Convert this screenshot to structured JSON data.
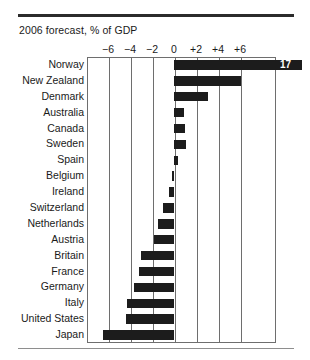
{
  "chart_data": {
    "type": "bar",
    "orientation": "horizontal",
    "title": "2006 forecast, % of GDP",
    "xlabel": "",
    "ylabel": "",
    "xlim": [
      -7.2,
      10.0
    ],
    "xticks": [
      -6,
      -4,
      -2,
      0,
      2,
      4,
      6
    ],
    "xticklabels": [
      "−6",
      "−4",
      "−2",
      "0",
      "+2",
      "+4",
      "+6"
    ],
    "grid": true,
    "grid_axis": "x",
    "legend": false,
    "bar_color": "#1c1c1c",
    "categories": [
      "Norway",
      "New Zealand",
      "Denmark",
      "Australia",
      "Canada",
      "Sweden",
      "Spain",
      "Belgium",
      "Ireland",
      "Switzerland",
      "Netherlands",
      "Austria",
      "Britain",
      "France",
      "Germany",
      "Italy",
      "United States",
      "Japan"
    ],
    "values": [
      17.0,
      6.1,
      3.1,
      0.9,
      1.0,
      1.1,
      0.4,
      -0.2,
      -0.5,
      -1.0,
      -1.5,
      -1.8,
      -3.0,
      -3.2,
      -3.6,
      -4.3,
      -4.4,
      -6.5
    ],
    "annotations": [
      {
        "category": "Norway",
        "text": "17",
        "note": "bar clipped at plot edge, value printed in white on bar"
      }
    ]
  },
  "axis": {
    "labels": [
      "−6",
      "−4",
      "−2",
      "0",
      "+2",
      "+4",
      "+6"
    ]
  },
  "rules": {
    "top": "top-rule",
    "bottom": "bottom-rule"
  }
}
